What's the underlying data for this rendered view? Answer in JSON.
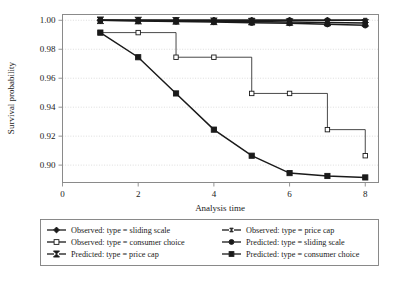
{
  "chart_data": {
    "type": "line",
    "title": "",
    "xlabel": "Analysis time",
    "ylabel": "Survival probability",
    "xlim": [
      0,
      8.35
    ],
    "ylim": [
      0.888,
      1.004
    ],
    "xticks": [
      "0",
      "2",
      "4",
      "6",
      "8"
    ],
    "xtick_values": [
      0,
      2,
      4,
      6,
      8
    ],
    "yticks": [
      "0.90",
      "0.92",
      "0.94",
      "0.96",
      "0.98",
      "1.00"
    ],
    "ytick_values": [
      0.9,
      0.92,
      0.94,
      0.96,
      0.98,
      1.0
    ],
    "grid": "horizontal-dotted",
    "legend_position": "below-plot",
    "x": [
      1,
      2,
      3,
      4,
      5,
      6,
      7,
      8
    ],
    "series": [
      {
        "name": "Observed: type = sliding scale",
        "marker": "diamond-filled",
        "style": "step",
        "values": [
          1.0,
          1.0,
          1.0,
          1.0,
          1.0,
          1.0,
          1.0,
          0.9985
        ]
      },
      {
        "name": "Observed: type = price cap",
        "marker": "bowtie-small",
        "style": "step",
        "values": [
          1.0,
          1.0,
          1.0,
          1.0,
          1.0,
          1.0,
          1.0,
          1.0
        ]
      },
      {
        "name": "Observed: type = consumer choice",
        "marker": "square-open",
        "style": "step",
        "values": [
          0.9915,
          0.9915,
          0.9745,
          0.9745,
          0.9495,
          0.9495,
          0.9245,
          0.9065
        ]
      },
      {
        "name": "Predicted: type = sliding scale",
        "marker": "circle-filled",
        "style": "line",
        "values": [
          1.0,
          0.9995,
          0.9992,
          0.9988,
          0.9983,
          0.998,
          0.9973,
          0.9965
        ]
      },
      {
        "name": "Predicted: type = price cap",
        "marker": "bowtie-filled",
        "style": "line",
        "values": [
          1.0,
          0.9998,
          0.9996,
          0.9993,
          0.9991,
          0.9988,
          0.9985,
          0.9982
        ]
      },
      {
        "name": "Predicted: type = consumer choice",
        "marker": "square-filled",
        "style": "line",
        "values": [
          0.9915,
          0.9745,
          0.9495,
          0.9245,
          0.9065,
          0.8945,
          0.8925,
          0.8915
        ]
      }
    ]
  },
  "axes": {
    "xlabel": "Analysis time",
    "ylabel": "Survival probability",
    "xticks": [
      "0",
      "2",
      "4",
      "6",
      "8"
    ],
    "yticks": [
      "1.00",
      "0.98",
      "0.96",
      "0.94",
      "0.92",
      "0.90"
    ]
  },
  "legend": {
    "entries": [
      {
        "label": "Observed: type = sliding scale",
        "marker": "diamond-filled"
      },
      {
        "label": "Observed: type = price cap",
        "marker": "bowtie-small"
      },
      {
        "label": "Observed: type = consumer choice",
        "marker": "square-open"
      },
      {
        "label": "Predicted: type = sliding scale",
        "marker": "circle-filled"
      },
      {
        "label": "Predicted: type = price cap",
        "marker": "bowtie-filled"
      },
      {
        "label": "Predicted: type = consumer choice",
        "marker": "square-filled"
      }
    ]
  },
  "colors": {
    "line": "#1a1a1a",
    "frame": "#8a8a8a",
    "grid": "#cfcfcf",
    "background": "#ffffff"
  }
}
